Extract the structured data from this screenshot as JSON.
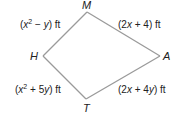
{
  "figure": {
    "type": "quadrilateral (kite)",
    "vertices": {
      "M": {
        "label": "M"
      },
      "H": {
        "label": "H"
      },
      "A": {
        "label": "A"
      },
      "T": {
        "label": "T"
      }
    },
    "sides": [
      {
        "from": "H",
        "to": "M",
        "var1": "x",
        "exp": "2",
        "op": " − ",
        "var2": "y",
        "coef": "",
        "unit": " ft",
        "text": "(x² − y) ft"
      },
      {
        "from": "M",
        "to": "A",
        "coef": "2",
        "var1": "x",
        "op": " + ",
        "const": "4",
        "unit": " ft",
        "text": "(2x + 4) ft"
      },
      {
        "from": "H",
        "to": "T",
        "var1": "x",
        "exp": "2",
        "op": " + ",
        "coef2": "5",
        "var2": "y",
        "unit": " ft",
        "text": "(x² + 5y) ft"
      },
      {
        "from": "T",
        "to": "A",
        "coef": "2",
        "var1": "x",
        "op": " + ",
        "coef2": "4",
        "var2": "y",
        "unit": " ft",
        "text": "(2x + 4y) ft"
      }
    ],
    "stroke_color": "#9a9a9a",
    "text_color": "#222222"
  }
}
